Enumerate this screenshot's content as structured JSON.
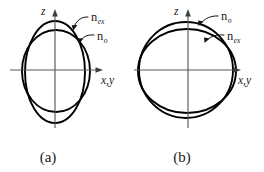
{
  "figure": {
    "type": "index-ellipsoid-cross-sections",
    "background_color": "#ffffff",
    "curve_color": "#000000",
    "axis_color": "#555a5e",
    "text_color": "#1a1a1a"
  },
  "panels": [
    {
      "id": "a",
      "caption": "(a)",
      "axes": {
        "vertical_label": "z",
        "horizontal_label": "x,y",
        "origin": [
          55,
          70
        ]
      },
      "curves": [
        {
          "name": "n-ex-curve",
          "label_main": "n",
          "label_sub": "ex",
          "shape": "prolate-ellipse",
          "rx": 30,
          "ry": 51,
          "center": [
            55,
            72
          ],
          "description": "tall ellipse, extraordinary index"
        },
        {
          "name": "n-o-curve",
          "label_main": "n",
          "label_sub": "o",
          "shape": "circle",
          "rx": 34,
          "ry": 41,
          "center": [
            56,
            71
          ],
          "description": "circle, ordinary index"
        }
      ],
      "labels": [
        {
          "name": "n-ex-label",
          "main": "n",
          "sub": "ex",
          "x": 91,
          "y": 20
        },
        {
          "name": "n-o-label",
          "main": "n",
          "sub": "o",
          "x": 97,
          "y": 38
        }
      ]
    },
    {
      "id": "b",
      "caption": "(b)",
      "axes": {
        "vertical_label": "z",
        "horizontal_label": "x,y",
        "origin": [
          56,
          70
        ]
      },
      "curves": [
        {
          "name": "n-o-curve",
          "label_main": "n",
          "label_sub": "o",
          "shape": "circle",
          "rx": 47,
          "ry": 48,
          "center": [
            54,
            70
          ],
          "description": "circle, ordinary index"
        },
        {
          "name": "n-ex-curve",
          "label_main": "n",
          "label_sub": "ex",
          "shape": "oblate-ellipse",
          "rx": 49,
          "ry": 42,
          "center": [
            55,
            71
          ],
          "description": "slightly oblate ellipse, extraordinary index"
        }
      ],
      "labels": [
        {
          "name": "n-o-label",
          "main": "n",
          "sub": "o",
          "x": 89,
          "y": 19
        },
        {
          "name": "n-ex-label",
          "main": "n",
          "sub": "ex",
          "x": 95,
          "y": 38
        }
      ]
    }
  ],
  "text": {
    "n_symbol": "n",
    "sub_ex": "ex",
    "sub_o": "o",
    "axis_z": "z",
    "axis_xy": "x,y",
    "caption_a": "(a)",
    "caption_b": "(b)"
  }
}
